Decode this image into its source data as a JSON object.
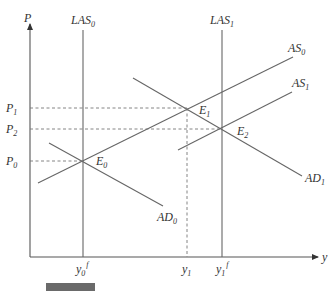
{
  "diagram": {
    "axes": {
      "y_label": "P",
      "x_label": "y"
    },
    "price_levels": [
      {
        "base": "P",
        "sub": "1",
        "y": 108
      },
      {
        "base": "P",
        "sub": "2",
        "y": 129
      },
      {
        "base": "P",
        "sub": "0",
        "y": 161
      }
    ],
    "output_ticks": [
      {
        "base": "y",
        "sub": "0",
        "sup": "f",
        "x": 83
      },
      {
        "base": "y",
        "sub": "1",
        "sup": "",
        "x": 187
      },
      {
        "base": "y",
        "sub": "1",
        "sup": "f",
        "x": 222
      }
    ],
    "curves": {
      "LAS0": {
        "base": "LAS",
        "sub": "0"
      },
      "LAS1": {
        "base": "LAS",
        "sub": "1"
      },
      "AS0": {
        "base": "AS",
        "sub": "0"
      },
      "AS1": {
        "base": "AS",
        "sub": "1"
      },
      "AD0": {
        "base": "AD",
        "sub": "0"
      },
      "AD1": {
        "base": "AD",
        "sub": "1"
      }
    },
    "equilibria": {
      "E0": {
        "base": "E",
        "sub": "0"
      },
      "E1": {
        "base": "E",
        "sub": "1"
      },
      "E2": {
        "base": "E",
        "sub": "2"
      }
    }
  },
  "caption": {
    "text": ""
  }
}
